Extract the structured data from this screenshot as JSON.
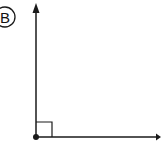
{
  "figure": {
    "label": "B",
    "angle_type": "right",
    "angle_degrees": 90,
    "colors": {
      "line": "#1a1a1a",
      "background": "#ffffff"
    }
  }
}
